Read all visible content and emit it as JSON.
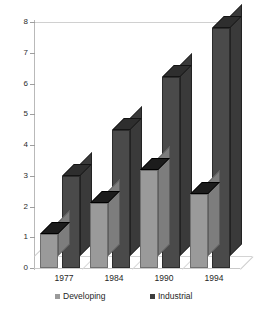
{
  "chart_data": {
    "type": "bar",
    "title": "",
    "subtitle": "",
    "xlabel": "",
    "ylabel": "",
    "categories": [
      "1977",
      "1984",
      "1990",
      "1994"
    ],
    "series": [
      {
        "name": "Developing",
        "values": [
          1.1,
          2.1,
          3.2,
          2.4
        ],
        "color": "#9a9a9a"
      },
      {
        "name": "Industrial",
        "values": [
          3.0,
          4.5,
          6.2,
          7.8
        ],
        "color": "#4a4a4a"
      }
    ],
    "ylim": [
      0,
      8
    ],
    "ytick_labels": [
      "0",
      "1",
      "2",
      "3",
      "4",
      "5",
      "6",
      "7",
      "8"
    ],
    "ytick_values": [
      0,
      1,
      2,
      3,
      4,
      5,
      6,
      7,
      8
    ],
    "grid": false,
    "legend_position": "bottom",
    "style": "3d-columns",
    "annotations": []
  },
  "legend": {
    "items": [
      {
        "label": "Developing",
        "marker": "square-swatch-light"
      },
      {
        "label": "Industrial",
        "marker": "square-swatch-dark"
      }
    ]
  }
}
